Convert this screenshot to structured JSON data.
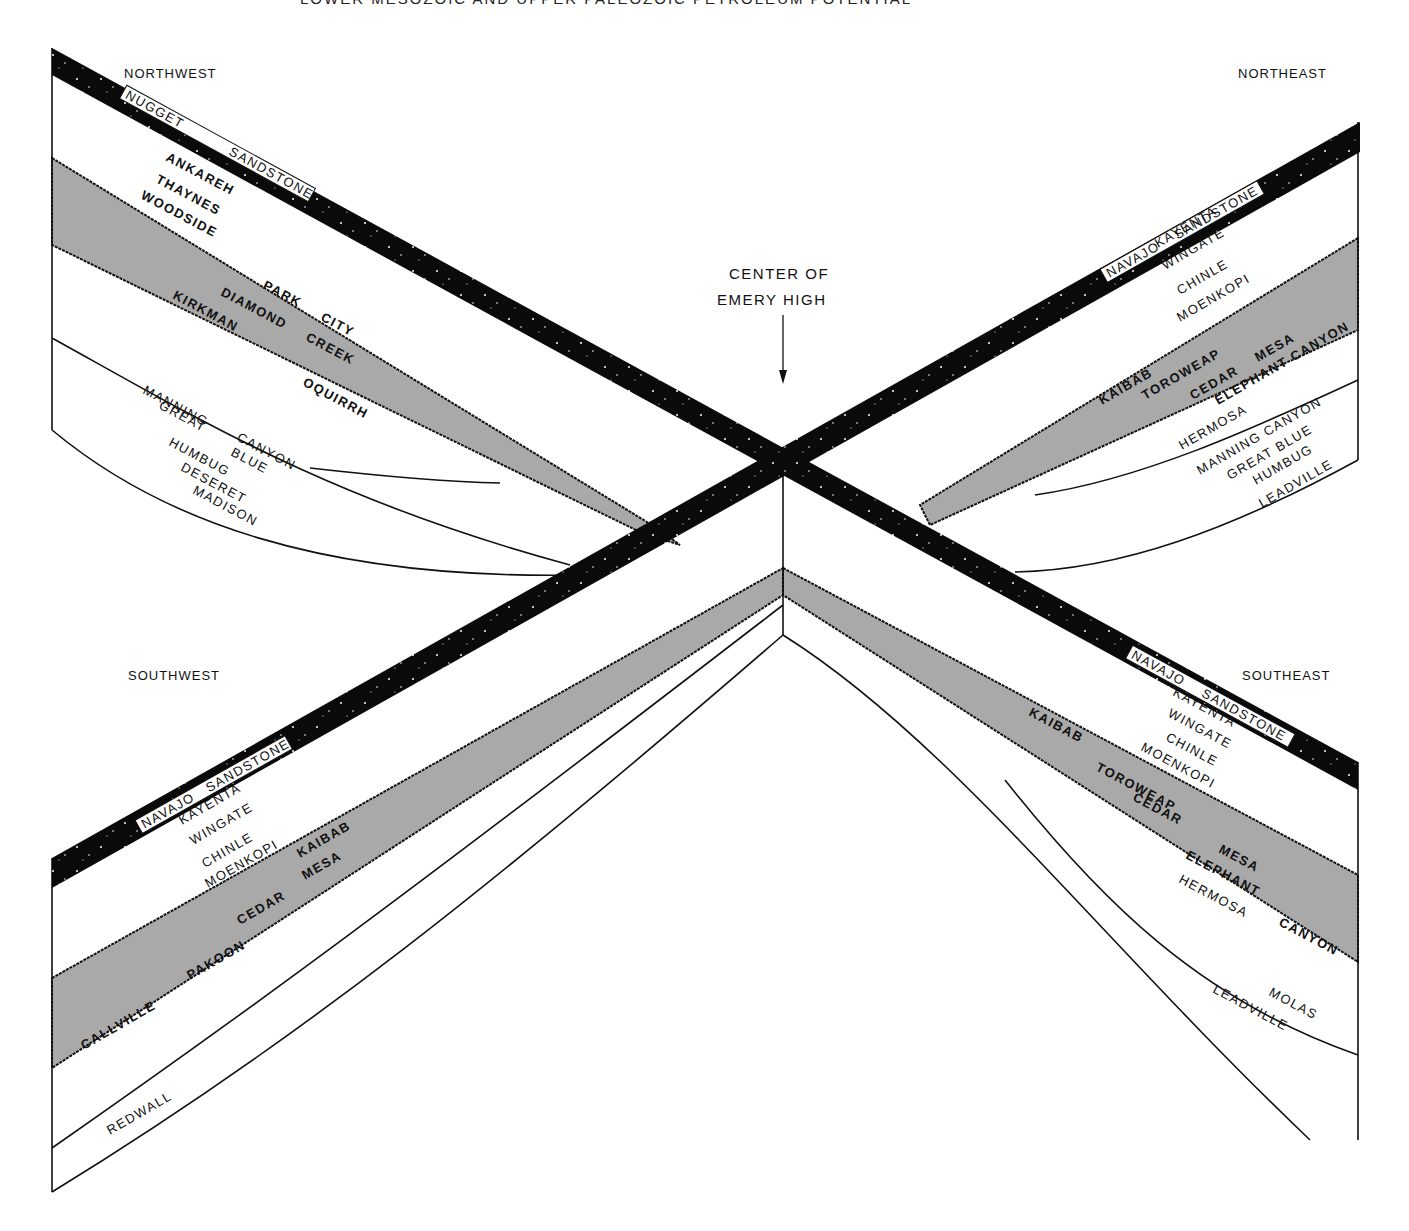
{
  "header": {
    "running_title": "LOWER MESOZOIC AND UPPER PALEOZOIC PETROLEUM POTENTIAL",
    "page_number": "229"
  },
  "center_label": {
    "line1": "CENTER OF",
    "line2": "EMERY HIGH"
  },
  "quadrants": {
    "northwest": {
      "direction": "NORTHWEST",
      "marker_bed": {
        "word1": "NUGGET",
        "word2": "SANDSTONE"
      },
      "upper_units": [
        "ANKAREH",
        "THAYNES",
        "WOODSIDE"
      ],
      "shaded_units": [
        "PARK",
        "CITY",
        "DIAMOND",
        "CREEK",
        "KIRKMAN",
        "OQUIRRH"
      ],
      "lower_units": [
        "MANNING",
        "CANYON",
        "GREAT",
        "BLUE",
        "HUMBUG",
        "DESERET",
        "MADISON"
      ]
    },
    "northeast": {
      "direction": "NORTHEAST",
      "marker_bed": {
        "word1": "NAVAJO",
        "word2": "SANDSTONE"
      },
      "upper_units": [
        "KAYENTA",
        "WINGATE",
        "CHINLE",
        "MOENKOPI"
      ],
      "shaded_units": [
        "KAIBAB",
        "TOROWEAP",
        "CEDAR",
        "MESA",
        "ELEPHANT CANYON"
      ],
      "lower_units": [
        "HERMOSA",
        "MANNING CANYON",
        "GREAT BLUE",
        "HUMBUG",
        "LEADVILLE"
      ]
    },
    "southwest": {
      "direction": "SOUTHWEST",
      "marker_bed": {
        "word1": "NAVAJO",
        "word2": "SANDSTONE"
      },
      "upper_units": [
        "KAYENTA",
        "WINGATE",
        "CHINLE",
        "MOENKOPI"
      ],
      "shaded_units": [
        "KAIBAB",
        "CEDAR",
        "MESA",
        "PAKOON",
        "CALLVILLE"
      ],
      "lower_units": [
        "REDWALL"
      ]
    },
    "southeast": {
      "direction": "SOUTHEAST",
      "marker_bed": {
        "word1": "NAVAJO",
        "word2": "SANDSTONE"
      },
      "upper_units": [
        "KAYENTA",
        "WINGATE",
        "CHINLE",
        "MOENKOPI"
      ],
      "shaded_units": [
        "KAIBAB",
        "TOROWEAP",
        "CEDAR",
        "MESA",
        "ELEPHANT",
        "CANYON"
      ],
      "lower_units": [
        "HERMOSA",
        "MOLAS",
        "LEADVILLE"
      ]
    }
  },
  "colors": {
    "marker_bed": "#0a0a0a",
    "shaded_interval": "#a9a9a9",
    "line": "#111111",
    "background": "#ffffff"
  }
}
